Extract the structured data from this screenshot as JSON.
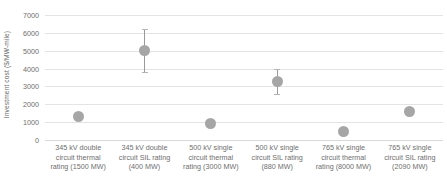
{
  "chart_data": {
    "type": "scatter",
    "title": "",
    "xlabel": "",
    "ylabel": "Investment cost ($/MW-mile)",
    "ylim": [
      0,
      7000
    ],
    "ytick_interval": 1000,
    "yticks": [
      "0",
      "1000",
      "2000",
      "3000",
      "4000",
      "5000",
      "6000",
      "7000"
    ],
    "grid": true,
    "legend": "none",
    "marker_color": "#a6a6a6",
    "errorbar_color": "#9a9a9a",
    "gridline_color": "#e4e4e4",
    "axis_text_color": "#6e6e6e",
    "categories": [
      "345 kV double circuit thermal rating (1500 MW)",
      "345 kV double circuit SIL rating (400 MW)",
      "500 kV single circuit thermal rating (3000 MW)",
      "500 kV single circuit SIL rating (880 MW)",
      "765 kV single circuit thermal rating (8000 MW)",
      "765 kV single circuit SIL rating (2090 MW)"
    ],
    "values": [
      1300,
      5000,
      950,
      3300,
      450,
      1600
    ],
    "error_low": [
      null,
      3800,
      null,
      2600,
      null,
      null
    ],
    "error_high": [
      null,
      6200,
      null,
      4000,
      null,
      null
    ],
    "points": [
      {
        "category": "345 kV double circuit thermal rating (1500 MW)",
        "value": 1300,
        "error_low": null,
        "error_high": null
      },
      {
        "category": "345 kV double circuit SIL rating (400 MW)",
        "value": 5000,
        "error_low": 3800,
        "error_high": 6200
      },
      {
        "category": "500 kV single circuit thermal rating (3000 MW)",
        "value": 950,
        "error_low": null,
        "error_high": null
      },
      {
        "category": "500 kV single circuit SIL rating (880 MW)",
        "value": 3300,
        "error_low": 2600,
        "error_high": 4000
      },
      {
        "category": "765 kV single circuit thermal rating (8000 MW)",
        "value": 450,
        "error_low": null,
        "error_high": null
      },
      {
        "category": "765 kV single circuit SIL rating (2090 MW)",
        "value": 1600,
        "error_low": null,
        "error_high": null
      }
    ]
  },
  "axis": {
    "y_title": "Investment cost ($/MW-mile)",
    "y_ticks": [
      "7000",
      "6000",
      "5000",
      "4000",
      "3000",
      "2000",
      "1000",
      "0"
    ]
  },
  "x_categories": [
    "345 kV double circuit thermal rating (1500 MW)",
    "345 kV double circuit SIL rating (400 MW)",
    "500 kV single circuit thermal rating (3000 MW)",
    "500 kV single circuit SIL rating (880 MW)",
    "765 kV single circuit thermal rating (8000 MW)",
    "765 kV single circuit SIL rating (2090 MW)"
  ]
}
